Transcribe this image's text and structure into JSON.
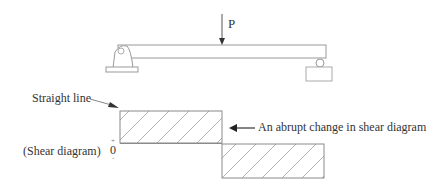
{
  "beam": {
    "load_label": "P",
    "supports": [
      "pin-support",
      "roller-support"
    ]
  },
  "shear_diagram": {
    "title": "(Shear diagram)",
    "zero_label": "0",
    "plus_label": "+",
    "minus_label": "-",
    "annotations": {
      "straight_line": "Straight line",
      "abrupt_change": "An abrupt change in shear diagram"
    },
    "segments": [
      {
        "name": "positive-shear",
        "sign": "+",
        "from": "left support",
        "to": "load P"
      },
      {
        "name": "negative-shear",
        "sign": "-",
        "from": "load P",
        "to": "right support"
      }
    ]
  },
  "colors": {
    "line": "#8a8a8a",
    "hatch": "#9a9a9a",
    "text": "#333333"
  }
}
